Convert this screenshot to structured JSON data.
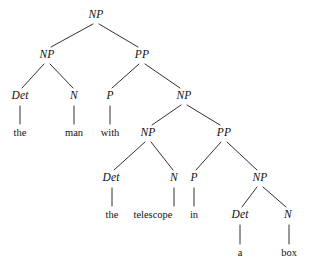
{
  "figure": {
    "kind": "syntax-tree",
    "sentence": "the man with the telescope in a box",
    "background_color": "#ffffff",
    "line_color": "#1a1a1a",
    "text_color": "#111111"
  },
  "nodes": [
    {
      "id": "np-root",
      "label": "NP",
      "type": "nonterminal",
      "x": 96,
      "y": 15
    },
    {
      "id": "np-l1",
      "label": "NP",
      "type": "nonterminal",
      "x": 47,
      "y": 55
    },
    {
      "id": "pp-l1",
      "label": "PP",
      "type": "nonterminal",
      "x": 142,
      "y": 55
    },
    {
      "id": "det-1",
      "label": "Det",
      "type": "nonterminal",
      "x": 20,
      "y": 96
    },
    {
      "id": "n-1",
      "label": "N",
      "type": "nonterminal",
      "x": 74,
      "y": 96
    },
    {
      "id": "p-1",
      "label": "P",
      "type": "nonterminal",
      "x": 110,
      "y": 96
    },
    {
      "id": "np-l2",
      "label": "NP",
      "type": "nonterminal",
      "x": 184,
      "y": 96
    },
    {
      "id": "word-the-1",
      "label": "the",
      "type": "terminal",
      "x": 20,
      "y": 133
    },
    {
      "id": "word-man",
      "label": "man",
      "type": "terminal",
      "x": 74,
      "y": 133
    },
    {
      "id": "word-with",
      "label": "with",
      "type": "terminal",
      "x": 110,
      "y": 133
    },
    {
      "id": "np-l3",
      "label": "NP",
      "type": "nonterminal",
      "x": 148,
      "y": 133
    },
    {
      "id": "pp-l3",
      "label": "PP",
      "type": "nonterminal",
      "x": 224,
      "y": 133
    },
    {
      "id": "det-2",
      "label": "Det",
      "type": "nonterminal",
      "x": 111,
      "y": 178
    },
    {
      "id": "n-2",
      "label": "N",
      "type": "nonterminal",
      "x": 174,
      "y": 178
    },
    {
      "id": "p-2",
      "label": "P",
      "type": "nonterminal",
      "x": 194,
      "y": 178
    },
    {
      "id": "np-l4",
      "label": "NP",
      "type": "nonterminal",
      "x": 260,
      "y": 178
    },
    {
      "id": "word-the-2",
      "label": "the",
      "type": "terminal",
      "x": 112,
      "y": 215
    },
    {
      "id": "word-telescope",
      "label": "telescope",
      "type": "terminal",
      "x": 153,
      "y": 215
    },
    {
      "id": "word-in",
      "label": "in",
      "type": "terminal",
      "x": 194,
      "y": 215
    },
    {
      "id": "det-3",
      "label": "Det",
      "type": "nonterminal",
      "x": 240,
      "y": 215
    },
    {
      "id": "n-3",
      "label": "N",
      "type": "nonterminal",
      "x": 288,
      "y": 215
    },
    {
      "id": "word-a",
      "label": "a",
      "type": "terminal",
      "x": 240,
      "y": 253
    },
    {
      "id": "word-box",
      "label": "box",
      "type": "terminal",
      "x": 289,
      "y": 253
    }
  ],
  "edges": [
    {
      "from": "np-root",
      "to": "np-l1",
      "x1": 93,
      "y1": 24,
      "x2": 51,
      "y2": 47
    },
    {
      "from": "np-root",
      "to": "pp-l1",
      "x1": 99,
      "y1": 24,
      "x2": 138,
      "y2": 47
    },
    {
      "from": "np-l1",
      "to": "det-1",
      "x1": 44,
      "y1": 64,
      "x2": 22,
      "y2": 88
    },
    {
      "from": "np-l1",
      "to": "n-1",
      "x1": 50,
      "y1": 64,
      "x2": 73,
      "y2": 88
    },
    {
      "from": "pp-l1",
      "to": "p-1",
      "x1": 139,
      "y1": 64,
      "x2": 112,
      "y2": 88
    },
    {
      "from": "pp-l1",
      "to": "np-l2",
      "x1": 145,
      "y1": 64,
      "x2": 180,
      "y2": 88
    },
    {
      "from": "det-1",
      "to": "word-the-1",
      "x1": 20,
      "y1": 106,
      "x2": 20,
      "y2": 124
    },
    {
      "from": "n-1",
      "to": "word-man",
      "x1": 74,
      "y1": 106,
      "x2": 74,
      "y2": 124
    },
    {
      "from": "p-1",
      "to": "word-with",
      "x1": 110,
      "y1": 106,
      "x2": 110,
      "y2": 124
    },
    {
      "from": "np-l2",
      "to": "np-l3",
      "x1": 181,
      "y1": 105,
      "x2": 152,
      "y2": 125
    },
    {
      "from": "np-l2",
      "to": "pp-l3",
      "x1": 187,
      "y1": 105,
      "x2": 220,
      "y2": 125
    },
    {
      "from": "np-l3",
      "to": "det-2",
      "x1": 145,
      "y1": 142,
      "x2": 114,
      "y2": 170
    },
    {
      "from": "np-l3",
      "to": "n-2",
      "x1": 151,
      "y1": 142,
      "x2": 173,
      "y2": 170
    },
    {
      "from": "pp-l3",
      "to": "p-2",
      "x1": 221,
      "y1": 142,
      "x2": 196,
      "y2": 170
    },
    {
      "from": "pp-l3",
      "to": "np-l4",
      "x1": 227,
      "y1": 142,
      "x2": 257,
      "y2": 170
    },
    {
      "from": "det-2",
      "to": "word-the-2",
      "x1": 112,
      "y1": 188,
      "x2": 112,
      "y2": 206
    },
    {
      "from": "n-2",
      "to": "word-telescope",
      "x1": 174,
      "y1": 188,
      "x2": 174,
      "y2": 206
    },
    {
      "from": "p-2",
      "to": "word-in",
      "x1": 194,
      "y1": 188,
      "x2": 194,
      "y2": 206
    },
    {
      "from": "np-l4",
      "to": "det-3",
      "x1": 257,
      "y1": 187,
      "x2": 242,
      "y2": 207
    },
    {
      "from": "np-l4",
      "to": "n-3",
      "x1": 263,
      "y1": 187,
      "x2": 286,
      "y2": 207
    },
    {
      "from": "det-3",
      "to": "word-a",
      "x1": 240,
      "y1": 225,
      "x2": 240,
      "y2": 244
    },
    {
      "from": "n-3",
      "to": "word-box",
      "x1": 289,
      "y1": 225,
      "x2": 289,
      "y2": 244
    }
  ]
}
